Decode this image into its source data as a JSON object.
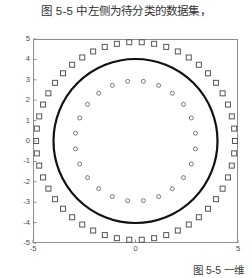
{
  "top_caption": "图 5-5 中左侧为待分类的数据集，",
  "bottom_caption": "图 5-5  一维",
  "chart_data": {
    "type": "scatter",
    "title": "",
    "xlabel": "",
    "ylabel": "",
    "xlim": [
      -5,
      5
    ],
    "ylim": [
      -5,
      5
    ],
    "xticks": [
      -5,
      0,
      5
    ],
    "xticklabels": [
      "-5",
      "0",
      "5"
    ],
    "yticks": [
      5,
      4,
      3,
      2,
      1,
      0,
      -1,
      -2,
      -3,
      -4,
      -5
    ],
    "yticklabels": [
      "5",
      "4",
      "3",
      "2",
      "1",
      "0",
      "-1",
      "-2",
      "-3",
      "-4",
      "-5"
    ],
    "grid": false,
    "legend": false,
    "frame_color": "#8c8c8c",
    "series": [
      {
        "name": "outer-class-squares",
        "marker": "square",
        "filled": false,
        "color": "#555555",
        "marker_size": 5,
        "shape": "ring",
        "radius": 4.85,
        "count": 50,
        "angle_offset_deg": 0
      },
      {
        "name": "inner-class-circles",
        "marker": "circle",
        "filled": false,
        "color": "#6a6a6a",
        "marker_size": 4,
        "shape": "ring",
        "radius": 2.95,
        "count": 24,
        "angle_offset_deg": 7.5
      }
    ],
    "boundary": {
      "name": "decision-boundary-circle",
      "shape": "circle",
      "center": [
        0,
        0
      ],
      "radius": 4.0,
      "color": "#111111",
      "line_width": 2.2
    }
  }
}
